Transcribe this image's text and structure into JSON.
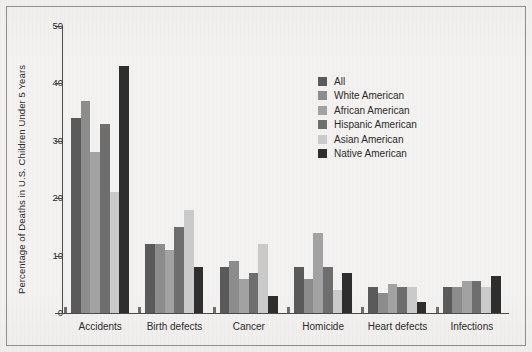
{
  "chart_data": {
    "type": "bar",
    "title": "",
    "subtitle": "",
    "xlabel": "",
    "ylabel": "Percentage of Deaths in U.S. Children Under 5 Years",
    "ylim": [
      0,
      50
    ],
    "yticks": [
      0,
      10,
      20,
      30,
      40,
      50
    ],
    "ytick_labels": [
      "0",
      "10",
      "20",
      "30",
      "40",
      "50"
    ],
    "grid": false,
    "legend_position": "upper right",
    "categories": [
      "Accidents",
      "Birth defects",
      "Cancer",
      "Homicide",
      "Heart defects",
      "Infections"
    ],
    "series": [
      {
        "name": "All",
        "color": "#5a5a5a",
        "values": [
          34,
          12,
          8,
          8,
          4.5,
          4.5
        ]
      },
      {
        "name": "White American",
        "color": "#8c8c8c",
        "values": [
          37,
          12,
          9,
          6,
          3.5,
          4.5
        ]
      },
      {
        "name": "African American",
        "color": "#a2a2a2",
        "values": [
          28,
          11,
          6,
          14,
          5,
          5.5
        ]
      },
      {
        "name": "Hispanic American",
        "color": "#6e6e6e",
        "values": [
          33,
          15,
          7,
          8,
          4.5,
          5.5
        ]
      },
      {
        "name": "Asian American",
        "color": "#cacaca",
        "values": [
          21,
          18,
          12,
          4,
          4.5,
          4.5
        ]
      },
      {
        "name": "Native American",
        "color": "#2e2e2e",
        "values": [
          43,
          8,
          3,
          7,
          2,
          6.5
        ]
      }
    ]
  },
  "legend": {
    "entries": [
      {
        "label": "All"
      },
      {
        "label": "White American"
      },
      {
        "label": "African American"
      },
      {
        "label": "Hispanic American"
      },
      {
        "label": "Asian American"
      },
      {
        "label": "Native American"
      }
    ]
  },
  "colors": {
    "figure_background": "#f3f2f0",
    "axis": "#4a4a4a",
    "border": "#8e8e8e",
    "text": "#2b2b2b"
  }
}
